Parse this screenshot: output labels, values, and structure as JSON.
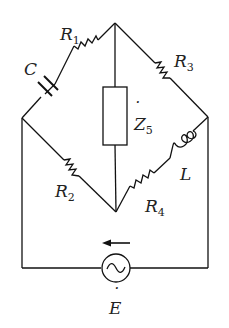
{
  "diagram": {
    "type": "ac-bridge-circuit",
    "components": {
      "R1": {
        "symbol": "R",
        "sub": "1",
        "kind": "resistor"
      },
      "C": {
        "symbol": "C",
        "kind": "capacitor"
      },
      "R3": {
        "symbol": "R",
        "sub": "3",
        "kind": "resistor"
      },
      "Z5": {
        "symbol": "Z",
        "sub": "5",
        "dot": "˙",
        "kind": "impedance"
      },
      "R2": {
        "symbol": "R",
        "sub": "2",
        "kind": "resistor"
      },
      "R4": {
        "symbol": "R",
        "sub": "4",
        "kind": "resistor"
      },
      "L": {
        "symbol": "L",
        "kind": "inductor"
      },
      "E": {
        "symbol": "E",
        "dot": "˙",
        "kind": "ac-source"
      }
    },
    "current_arrow": "left",
    "colors": {
      "line": "#111111",
      "background": "#ffffff"
    }
  }
}
